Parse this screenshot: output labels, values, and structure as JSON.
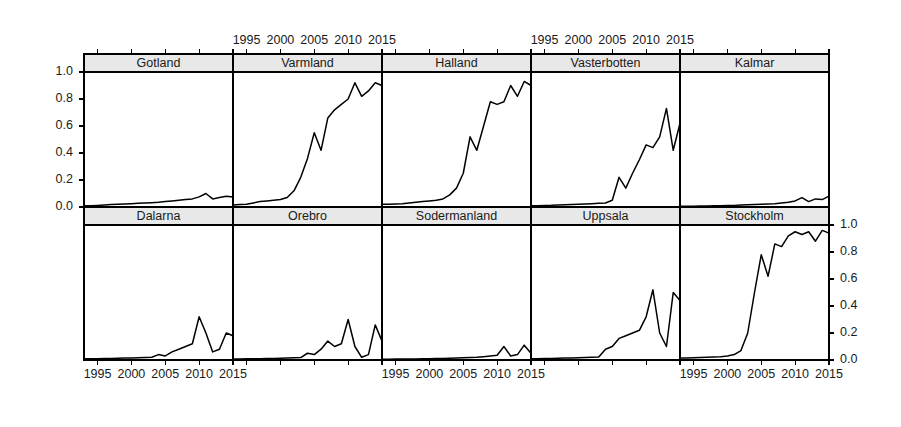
{
  "chart_data": {
    "type": "line",
    "title": "",
    "subtitle": "",
    "xlabel": "",
    "ylabel": "",
    "xlim": [
      1993,
      2015
    ],
    "ylim": [
      0.0,
      1.0
    ],
    "grid": false,
    "legend": "none",
    "layout": {
      "rows": 2,
      "cols": 5,
      "style": "lattice-trellis",
      "x_axis_positions": [
        "top-alternating",
        "bottom-alternating"
      ],
      "y_axis_positions": [
        "left-row1",
        "right-row2"
      ]
    },
    "x_tick_labels": [
      "1995",
      "2000",
      "2005",
      "2010",
      "2015"
    ],
    "x_tick_values": [
      1995,
      2000,
      2005,
      2010,
      2015
    ],
    "y_tick_labels": [
      "0.0",
      "0.2",
      "0.4",
      "0.6",
      "0.8",
      "1.0"
    ],
    "y_tick_values": [
      0.0,
      0.2,
      0.4,
      0.6,
      0.8,
      1.0
    ],
    "x": [
      1993,
      1994,
      1995,
      1996,
      1997,
      1998,
      1999,
      2000,
      2001,
      2002,
      2003,
      2004,
      2005,
      2006,
      2007,
      2008,
      2009,
      2010,
      2011,
      2012,
      2013,
      2014,
      2015
    ],
    "series": [
      {
        "name": "Gotland",
        "row": 1,
        "col": 1,
        "values": [
          0.01,
          0.01,
          0.012,
          0.015,
          0.018,
          0.02,
          0.022,
          0.025,
          0.028,
          0.03,
          0.032,
          0.035,
          0.04,
          0.045,
          0.05,
          0.055,
          0.06,
          0.075,
          0.1,
          0.06,
          0.07,
          0.08,
          0.075
        ]
      },
      {
        "name": "Varmland",
        "row": 1,
        "col": 2,
        "values": [
          0.015,
          0.018,
          0.02,
          0.03,
          0.04,
          0.045,
          0.05,
          0.055,
          0.07,
          0.12,
          0.22,
          0.36,
          0.55,
          0.42,
          0.66,
          0.72,
          0.76,
          0.8,
          0.92,
          0.82,
          0.86,
          0.92,
          0.9
        ]
      },
      {
        "name": "Halland",
        "row": 1,
        "col": 3,
        "values": [
          0.02,
          0.02,
          0.022,
          0.025,
          0.03,
          0.035,
          0.04,
          0.045,
          0.05,
          0.06,
          0.09,
          0.14,
          0.25,
          0.52,
          0.42,
          0.6,
          0.78,
          0.76,
          0.78,
          0.9,
          0.82,
          0.93,
          0.9
        ]
      },
      {
        "name": "Vasterbotten",
        "row": 1,
        "col": 4,
        "values": [
          0.01,
          0.01,
          0.012,
          0.013,
          0.015,
          0.016,
          0.018,
          0.02,
          0.022,
          0.025,
          0.028,
          0.03,
          0.05,
          0.22,
          0.14,
          0.25,
          0.35,
          0.46,
          0.44,
          0.52,
          0.73,
          0.42,
          0.62
        ]
      },
      {
        "name": "Kalmar",
        "row": 1,
        "col": 5,
        "values": [
          0.005,
          0.005,
          0.006,
          0.007,
          0.008,
          0.009,
          0.01,
          0.011,
          0.012,
          0.014,
          0.016,
          0.018,
          0.02,
          0.022,
          0.025,
          0.03,
          0.035,
          0.045,
          0.07,
          0.04,
          0.06,
          0.055,
          0.08
        ]
      },
      {
        "name": "Dalarna",
        "row": 2,
        "col": 1,
        "values": [
          0.01,
          0.01,
          0.01,
          0.012,
          0.012,
          0.013,
          0.014,
          0.015,
          0.016,
          0.018,
          0.02,
          0.04,
          0.03,
          0.06,
          0.08,
          0.1,
          0.12,
          0.32,
          0.2,
          0.06,
          0.08,
          0.2,
          0.18
        ]
      },
      {
        "name": "Orebro",
        "row": 2,
        "col": 2,
        "values": [
          0.008,
          0.008,
          0.009,
          0.009,
          0.01,
          0.011,
          0.012,
          0.013,
          0.014,
          0.016,
          0.018,
          0.05,
          0.04,
          0.08,
          0.14,
          0.1,
          0.12,
          0.3,
          0.1,
          0.02,
          0.04,
          0.26,
          0.14
        ]
      },
      {
        "name": "Sodermanland",
        "row": 2,
        "col": 3,
        "values": [
          0.006,
          0.006,
          0.007,
          0.007,
          0.008,
          0.008,
          0.009,
          0.01,
          0.011,
          0.012,
          0.013,
          0.015,
          0.016,
          0.018,
          0.02,
          0.025,
          0.03,
          0.035,
          0.1,
          0.03,
          0.04,
          0.11,
          0.05
        ]
      },
      {
        "name": "Uppsala",
        "row": 2,
        "col": 4,
        "values": [
          0.01,
          0.01,
          0.012,
          0.012,
          0.013,
          0.014,
          0.015,
          0.016,
          0.018,
          0.02,
          0.022,
          0.08,
          0.1,
          0.16,
          0.18,
          0.2,
          0.22,
          0.32,
          0.52,
          0.2,
          0.1,
          0.5,
          0.44
        ]
      },
      {
        "name": "Stockholm",
        "row": 2,
        "col": 5,
        "values": [
          0.015,
          0.015,
          0.016,
          0.018,
          0.02,
          0.022,
          0.025,
          0.03,
          0.04,
          0.07,
          0.2,
          0.5,
          0.78,
          0.62,
          0.86,
          0.84,
          0.92,
          0.95,
          0.93,
          0.95,
          0.88,
          0.96,
          0.94
        ]
      }
    ]
  },
  "axes": {
    "top_label_groups": [
      {
        "panel": "Varmland",
        "labels": [
          "1995",
          "2000",
          "2005",
          "2010",
          "2015"
        ]
      },
      {
        "panel": "Vasterbotten",
        "labels": [
          "1995",
          "2000",
          "2005",
          "2010",
          "2015"
        ]
      }
    ],
    "bottom_label_groups": [
      {
        "panel": "Dalarna",
        "labels": [
          "1995",
          "2000",
          "2005",
          "2010",
          "2015"
        ]
      },
      {
        "panel": "Sodermanland",
        "labels": [
          "1995",
          "2000",
          "2005",
          "2010",
          "2015"
        ]
      },
      {
        "panel": "Stockholm",
        "labels": [
          "1995",
          "2000",
          "2005",
          "2010",
          "2015"
        ]
      }
    ],
    "left_labels": [
      "1.0",
      "0.8",
      "0.6",
      "0.4",
      "0.2",
      "0.0"
    ],
    "right_labels": [
      "1.0",
      "0.8",
      "0.6",
      "0.4",
      "0.2",
      "0.0"
    ]
  },
  "colors": {
    "line": "#000000",
    "strip_fill": "#e8e8e8",
    "frame": "#000000",
    "background": "#ffffff",
    "text": "#1a1a1a"
  }
}
